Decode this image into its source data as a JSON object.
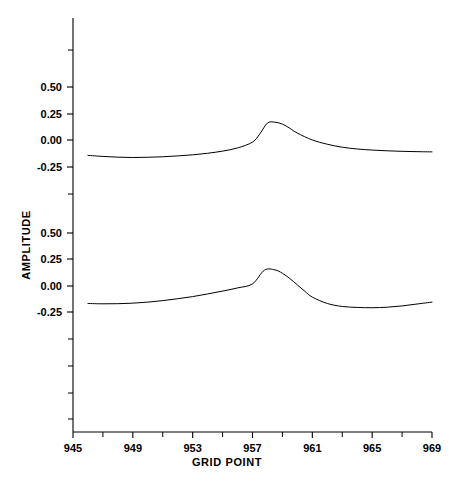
{
  "chart_data": {
    "type": "line",
    "title": "",
    "xlabel": "GRID POINT",
    "ylabel": "AMPLITUDE",
    "xlim": [
      945,
      969
    ],
    "x_major_ticks": [
      945,
      949,
      953,
      957,
      961,
      965,
      969
    ],
    "x_tick_labels": [
      "945",
      "949",
      "953",
      "957",
      "961",
      "965",
      "969"
    ],
    "x_minor_ticks": [
      947,
      951,
      955,
      959,
      963,
      967
    ],
    "grid": false,
    "legend": null,
    "y_tick_labels_upper": [
      "0.50",
      "0.25",
      "0.00",
      "-0.25"
    ],
    "y_tick_labels_lower": [
      "0.50",
      "0.25",
      "0.00",
      "-0.25"
    ],
    "y_axis_note": "Stacked offset traces; the amplitude tick sequence 0.50 / 0.25 / 0.00 / -0.25 repeats once per trace panel.",
    "series": [
      {
        "name": "upper trace",
        "panel": "upper",
        "x": [
          946.0,
          947.0,
          948.0,
          949.0,
          950.0,
          951.0,
          952.0,
          953.0,
          954.0,
          955.0,
          956.0,
          957.0,
          957.5,
          958.0,
          958.5,
          959.0,
          959.5,
          960.0,
          961.0,
          962.0,
          963.0,
          964.0,
          965.0,
          966.0,
          967.0,
          968.0,
          969.0
        ],
        "values": [
          -0.145,
          -0.155,
          -0.162,
          -0.165,
          -0.163,
          -0.158,
          -0.15,
          -0.14,
          -0.125,
          -0.105,
          -0.075,
          -0.02,
          0.06,
          0.16,
          0.168,
          0.15,
          0.11,
          0.065,
          0.0,
          -0.04,
          -0.068,
          -0.085,
          -0.095,
          -0.102,
          -0.107,
          -0.11,
          -0.112
        ]
      },
      {
        "name": "lower trace",
        "panel": "lower",
        "x": [
          946.0,
          947.0,
          948.0,
          949.0,
          950.0,
          951.0,
          952.0,
          953.0,
          954.0,
          955.0,
          956.0,
          957.0,
          957.8,
          958.5,
          959.0,
          959.5,
          960.0,
          960.5,
          961.0,
          962.0,
          963.0,
          964.0,
          965.0,
          966.0,
          967.0,
          968.0,
          969.0
        ],
        "values": [
          -0.165,
          -0.168,
          -0.167,
          -0.162,
          -0.152,
          -0.138,
          -0.12,
          -0.1,
          -0.075,
          -0.048,
          -0.018,
          0.02,
          0.15,
          0.152,
          0.12,
          0.07,
          0.01,
          -0.05,
          -0.105,
          -0.165,
          -0.193,
          -0.202,
          -0.205,
          -0.2,
          -0.188,
          -0.17,
          -0.152
        ]
      }
    ]
  },
  "axis": {
    "x_title": "GRID POINT",
    "y_title": "AMPLITUDE"
  }
}
